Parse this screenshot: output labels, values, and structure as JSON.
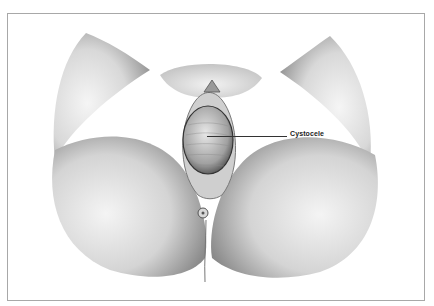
{
  "figure": {
    "type": "anatomical-illustration",
    "style": "pencil-sketch",
    "labels": [
      {
        "text": "Cystocele",
        "pointer": "leader-line"
      }
    ]
  },
  "colors": {
    "frame_border": "#a8a8a8",
    "label_text": "#222222",
    "leader_line": "#333333"
  }
}
